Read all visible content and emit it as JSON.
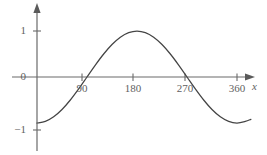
{
  "chart_data": {
    "type": "line",
    "title": "",
    "xlabel": "x",
    "ylabel": "",
    "xlim": [
      0,
      400
    ],
    "ylim": [
      -1.35,
      1.3
    ],
    "grid": false,
    "legend": null,
    "function": "y = -cos(x)",
    "x_ticks": [
      {
        "value": 90,
        "label": "90"
      },
      {
        "value": 180,
        "label": "180"
      },
      {
        "value": 270,
        "label": "270"
      },
      {
        "value": 360,
        "label": "360"
      }
    ],
    "y_ticks": [
      {
        "value": 1,
        "label": "1"
      },
      {
        "value": 0,
        "label": "0"
      },
      {
        "value": -1,
        "label": "−1"
      }
    ],
    "series": [
      {
        "name": "y = -cos(x)",
        "color": "#444444",
        "x": [
          0,
          15,
          30,
          45,
          60,
          75,
          90,
          105,
          120,
          135,
          150,
          165,
          180,
          195,
          210,
          225,
          240,
          255,
          270,
          285,
          300,
          315,
          330,
          345,
          360,
          375,
          385
        ],
        "values": [
          -1.0,
          -0.966,
          -0.866,
          -0.707,
          -0.5,
          -0.259,
          0.0,
          0.259,
          0.5,
          0.707,
          0.866,
          0.966,
          1.0,
          0.966,
          0.866,
          0.707,
          0.5,
          0.259,
          0.0,
          -0.259,
          -0.5,
          -0.707,
          -0.866,
          -0.966,
          -1.0,
          -0.966,
          -0.92
        ]
      }
    ],
    "annotations": []
  },
  "axes": {
    "x_axis_name": "x",
    "x_arrow": "arrow-right",
    "y_arrow": "arrow-up",
    "axis_color": "#6a6a6a",
    "curve_color": "#444444"
  }
}
